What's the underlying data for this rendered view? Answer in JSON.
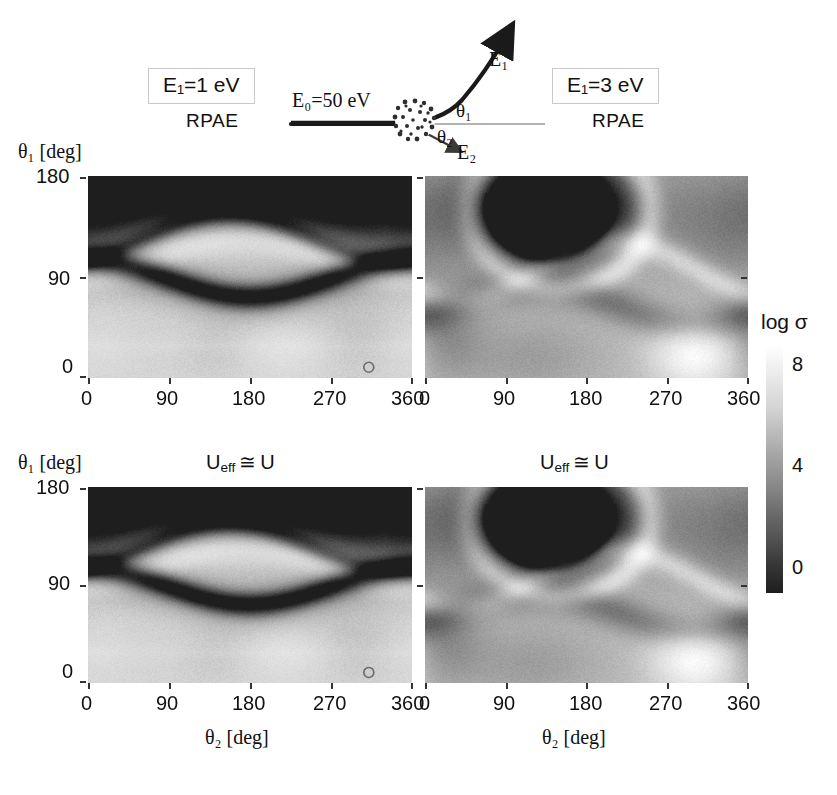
{
  "schematic": {
    "left_box_label": "E₁=1 eV",
    "right_box_label": "E₁=3 eV",
    "left_method": "RPAE",
    "right_method": "RPAE",
    "incident_label": "E₀=50 eV",
    "outgoing_fast_label": "E₁",
    "outgoing_slow_label": "E₂",
    "angle1_label": "θ₁",
    "angle2_label": "θ₂",
    "target_icon": "stippled-atom-cluster"
  },
  "colorbar": {
    "title": "log σ",
    "ticks": [
      "8",
      "4",
      "0"
    ],
    "min": 0,
    "max": 10,
    "orientation": "vertical",
    "colormap": "grayscale-dark-low-to-white-high"
  },
  "axes": {
    "x_label": "θ₂ [deg]",
    "y_label": "θ₁ [deg]",
    "x_ticks": [
      "0",
      "90",
      "180",
      "270",
      "360"
    ],
    "y_ticks": [
      "180",
      "90",
      "0"
    ]
  },
  "panels": [
    {
      "id": "top-left",
      "title": "RPAE",
      "energy": "E₁=1 eV",
      "row_label": "",
      "show_y_ticks": true,
      "show_x_ticks": true
    },
    {
      "id": "top-right",
      "title": "RPAE",
      "energy": "E₁=3 eV",
      "row_label": "",
      "show_y_ticks": false,
      "show_x_ticks": true
    },
    {
      "id": "bottom-left",
      "title": "U_eff ≅ U",
      "energy": "E₁=1 eV",
      "row_label": "U",
      "show_y_ticks": true,
      "show_x_ticks": true
    },
    {
      "id": "bottom-right",
      "title": "U_eff ≅ U",
      "energy": "E₁=3 eV",
      "row_label": "U",
      "show_y_ticks": false,
      "show_x_ticks": true
    }
  ],
  "row2_title_left": "U",
  "row2_title_right": "U",
  "row2_title_sub": "eff",
  "row2_title_approx": "≅",
  "row2_title_tail": "U",
  "chart_data": {
    "type": "heatmap",
    "title": "",
    "xlabel": "θ₂ [deg]",
    "ylabel": "θ₁ [deg]",
    "xlim": [
      0,
      360
    ],
    "ylim": [
      0,
      180
    ],
    "zlabel": "log σ",
    "zlim": [
      0,
      10
    ],
    "grid": false,
    "legend_position": "right",
    "colormap": "gray",
    "panels": [
      {
        "name": "top-left",
        "annotation": "RPAE, E₁=1 eV",
        "description": "Dark high-theta1 lobe centered near theta2=150deg spanning theta1 120-180; a bright band near theta1=100-130; a dark ridge crossing near theta1=85 dipping to theta1=70 at theta2=180; light region below theta1=60 with faint gray blobs near theta2=140 and theta2=300",
        "features": [
          {
            "kind": "dark-lobe",
            "x": 150,
            "y": 175,
            "zval": 1.0
          },
          {
            "kind": "dark-ridge",
            "x": 180,
            "y": 80,
            "zval": 1.5
          },
          {
            "kind": "bright-band",
            "x": 180,
            "y": 115,
            "zval": 8.5
          },
          {
            "kind": "bright-floor",
            "x": 180,
            "y": 30,
            "zval": 8.0
          },
          {
            "kind": "faint-blob",
            "x": 140,
            "y": 25,
            "zval": 6.0
          },
          {
            "kind": "faint-blob",
            "x": 300,
            "y": 30,
            "zval": 6.2
          },
          {
            "kind": "tiny-circle-marker",
            "x": 312,
            "y": 6,
            "zval": 7.0
          }
        ]
      },
      {
        "name": "top-right",
        "annotation": "RPAE, E₁=3 eV",
        "description": "Compact dark ellipse centered theta2=140deg theta1=150deg; bright arc wrapping below and right of it; a gray mid band near theta1=70-95; a bright white blob near theta2=300deg theta1=25deg",
        "features": [
          {
            "kind": "dark-ellipse",
            "x": 140,
            "y": 150,
            "zval": 0.5
          },
          {
            "kind": "bright-arc",
            "x": 150,
            "y": 105,
            "zval": 9.0
          },
          {
            "kind": "gray-band",
            "x": 120,
            "y": 70,
            "zval": 4.5
          },
          {
            "kind": "white-blob",
            "x": 300,
            "y": 25,
            "zval": 9.5
          },
          {
            "kind": "gray-floor",
            "x": 120,
            "y": 20,
            "zval": 5.5
          }
        ]
      },
      {
        "name": "bottom-left",
        "annotation": "U_eff ≅ U, E₁=1 eV",
        "description": "Nearly identical to top-left: dark upper lobe near theta2=140deg, bright band, dark ridge near theta1=85, bright lower region with faint blobs",
        "features": [
          {
            "kind": "dark-lobe",
            "x": 145,
            "y": 175,
            "zval": 1.0
          },
          {
            "kind": "dark-ridge",
            "x": 175,
            "y": 82,
            "zval": 1.6
          },
          {
            "kind": "bright-band",
            "x": 175,
            "y": 118,
            "zval": 8.3
          },
          {
            "kind": "bright-floor",
            "x": 180,
            "y": 30,
            "zval": 8.2
          },
          {
            "kind": "faint-blob",
            "x": 130,
            "y": 25,
            "zval": 6.2
          },
          {
            "kind": "faint-blob",
            "x": 300,
            "y": 32,
            "zval": 6.0
          },
          {
            "kind": "tiny-circle-marker",
            "x": 312,
            "y": 6,
            "zval": 7.0
          }
        ]
      },
      {
        "name": "bottom-right",
        "annotation": "U_eff ≅ U, E₁=3 eV",
        "description": "Compact dark ellipse centered theta2=135deg theta1=150deg with sharp dark rim; bright arc below; gray mid band; bright white blob near theta2=305deg theta1=22deg",
        "features": [
          {
            "kind": "dark-ellipse",
            "x": 135,
            "y": 150,
            "zval": 0.4
          },
          {
            "kind": "bright-arc",
            "x": 150,
            "y": 105,
            "zval": 9.0
          },
          {
            "kind": "gray-band",
            "x": 110,
            "y": 70,
            "zval": 4.5
          },
          {
            "kind": "white-blob",
            "x": 305,
            "y": 22,
            "zval": 9.6
          },
          {
            "kind": "gray-floor",
            "x": 110,
            "y": 20,
            "zval": 5.4
          }
        ]
      }
    ]
  }
}
